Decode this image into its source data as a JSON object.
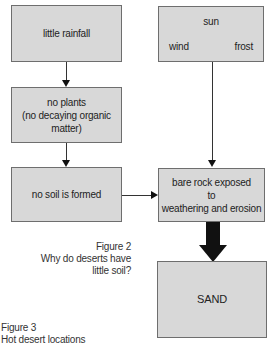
{
  "diagram": {
    "left_column": [
      {
        "id": "little-rainfall",
        "lines": [
          "little rainfall"
        ]
      },
      {
        "id": "no-plants",
        "lines": [
          "no plants",
          "(no decaying organic",
          "matter)"
        ]
      },
      {
        "id": "no-soil",
        "lines": [
          "no soil is formed"
        ]
      }
    ],
    "right_column": {
      "weather": {
        "top": "sun",
        "left": "wind",
        "right": "frost"
      },
      "bare_rock": {
        "lines": [
          "bare rock exposed",
          "to",
          "weathering and erosion"
        ]
      },
      "sand": {
        "label": "SAND"
      }
    },
    "colors": {
      "box_fill": "#d8d8d8",
      "box_border": "#6e6e6e",
      "arrow": "#111111"
    }
  },
  "captions": {
    "figure2": {
      "number": "Figure 2",
      "line1": "Why do deserts have",
      "line2": "little soil?"
    },
    "figure3": {
      "number": "Figure 3",
      "title": "Hot desert locations"
    }
  }
}
